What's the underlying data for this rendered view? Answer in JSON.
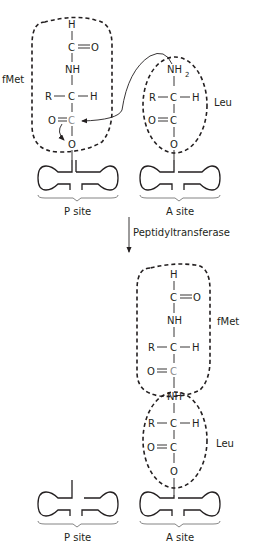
{
  "diagram": {
    "before": {
      "p_site": {
        "label": "P site",
        "amino_acid_label": "fMet",
        "atoms": {
          "h": "H",
          "c1": "C",
          "o1": "O",
          "nh": "NH",
          "r": "R",
          "ca": "C",
          "h2": "H",
          "o2": "O",
          "c2": "C",
          "o3": "O"
        }
      },
      "a_site": {
        "label": "A site",
        "amino_acid_label": "Leu",
        "atoms": {
          "nh2": "NH",
          "sub2": "2",
          "r": "R",
          "ca": "C",
          "h": "H",
          "o1": "O",
          "c": "C",
          "o2": "O"
        }
      }
    },
    "reaction": {
      "enzyme_label": "Peptidyltransferase"
    },
    "after": {
      "p_site": {
        "label": "P site"
      },
      "a_site": {
        "label": "A site",
        "fmet_label": "fMet",
        "leu_label": "Leu",
        "atoms": {
          "h": "H",
          "c1": "C",
          "o1": "O",
          "nh": "NH",
          "r": "R",
          "ca": "C",
          "h2": "H",
          "o2": "O",
          "c2": "C",
          "nh2": "NH",
          "r2": "R",
          "ca2": "C",
          "h3": "H",
          "o3": "O",
          "c3": "C",
          "o4": "O"
        }
      }
    },
    "colors": {
      "ink": "#231f20",
      "highlight_carbon": "#8a8a8a"
    }
  }
}
